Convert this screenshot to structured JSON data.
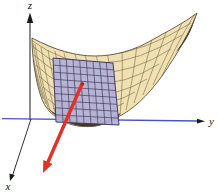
{
  "figure": {
    "axis_labels": {
      "x": "x",
      "y": "y",
      "z": "z"
    },
    "colors": {
      "background": "#ffffff",
      "surface_fill": "#f1e0b0",
      "surface_line": "#6b5f49",
      "surface_shadow": "#45382a",
      "surface_tip_dark": "#2f2d2b",
      "plane_fill": "#b5afd7",
      "plane_grid": "#3d3d5e",
      "gradient_arrow": "#e03227",
      "gradient_point": "#b8241c",
      "y_axis_blue": "#4852c8",
      "axis_black": "#1a1a1a"
    }
  }
}
